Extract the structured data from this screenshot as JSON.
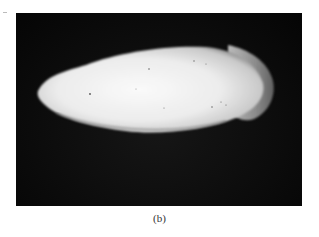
{
  "figure": {
    "panel_label": "(b)",
    "image_description": "Photograph of an elongated white oval specimen (cuttlebone-like) with a translucent rounded tip on the right, on a black background",
    "colors": {
      "background": "#0b0b0b",
      "specimen": "#f2f2f2",
      "specimen_edge": "#bdbdbd",
      "tip": "#9a9a9a",
      "page": "#ffffff"
    }
  }
}
